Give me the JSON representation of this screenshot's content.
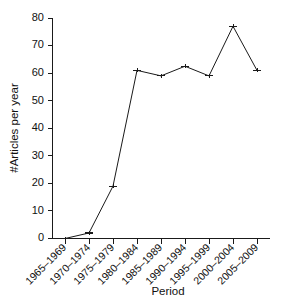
{
  "chart_data": {
    "type": "line",
    "title": "",
    "xlabel": "Period",
    "ylabel": "#Articles per year",
    "categories": [
      "1965–1969",
      "1970–1974",
      "1975–1979",
      "1980–1984",
      "1985–1989",
      "1990–1994",
      "1995–1999",
      "2000–2004",
      "2005–2009"
    ],
    "values": [
      0,
      2,
      19,
      61,
      59,
      62.5,
      59,
      77,
      61
    ],
    "yticks": [
      0,
      10,
      20,
      30,
      40,
      50,
      60,
      70,
      80
    ],
    "ytick_labels": [
      "0",
      "10",
      "20",
      "30",
      "40",
      "50",
      "60",
      "70",
      "80"
    ],
    "ylim": [
      0,
      80
    ],
    "xlim_categories": 9,
    "grid": false,
    "legend": false,
    "legend_position": "none",
    "line_color": "#1a1a1a",
    "background_color": "#ffffff",
    "marker": "error-bar-cap",
    "xtick_rotation_deg": -45
  },
  "axes": {
    "y_title": "#Articles per year",
    "x_title": "Period"
  }
}
